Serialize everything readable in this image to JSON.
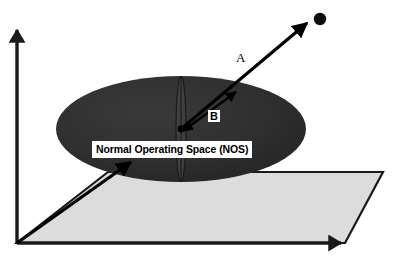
{
  "figure": {
    "background_color": "#ffffff"
  },
  "axes": {
    "vertical": {
      "name": "vertical-axis",
      "color": "#000000",
      "origin": [
        17,
        243
      ],
      "tip": [
        17,
        26
      ]
    },
    "horizontal": {
      "name": "horizontal-axis",
      "color": "#000000",
      "origin": [
        17,
        243
      ],
      "tip": [
        348,
        243
      ]
    }
  },
  "plane": {
    "name": "ground-plane",
    "fill_color": "#dcdcdc",
    "edge_color": "#1a1a1a",
    "points": "17,243 345,243 383,172 108,172"
  },
  "ellipse": {
    "name": "normal-operating-space-ellipse",
    "fill_color": "#2e2e2e",
    "center": [
      181,
      129
    ],
    "rx": 125,
    "ry": 53,
    "label": "Normal Operating Space (NOS)",
    "inner_sliver": {
      "name": "ellipse-center-sliver",
      "fill_color": "#3c3c3c",
      "rx": 5,
      "ry": 53
    }
  },
  "vectors": {
    "deviation": {
      "name": "deviation-vector-A",
      "label": "A",
      "color": "#000000",
      "from": [
        181,
        129
      ],
      "to": [
        311,
        19
      ],
      "endpoint_dot": [
        320,
        19
      ],
      "endpoint_dot_r": 6
    },
    "boundary": {
      "name": "boundary-vector-B",
      "label": "B",
      "color": "#000000",
      "from": [
        181,
        129
      ],
      "to": [
        239,
        89
      ],
      "double_headed": true
    },
    "callout": {
      "name": "nos-callout-arrow",
      "color": "#000000",
      "from": [
        17,
        243
      ],
      "to": [
        133,
        161
      ]
    }
  },
  "labels": {
    "nos": "Normal Operating Space (NOS)",
    "a": "A",
    "b": "B"
  }
}
